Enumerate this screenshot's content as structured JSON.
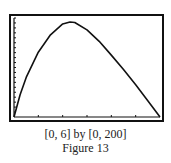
{
  "figure": {
    "window_caption": "[0, 6] by [0, 200]",
    "figure_label": "Figure 13"
  },
  "chart_data": {
    "type": "line",
    "title": "",
    "xlabel": "",
    "ylabel": "",
    "xlim": [
      0,
      6
    ],
    "ylim": [
      0,
      200
    ],
    "xscale_ticks": 1,
    "yscale_ticks": 10,
    "grid": false,
    "legend": null,
    "series": [
      {
        "name": "curve",
        "x": [
          0,
          0.25,
          0.5,
          1,
          1.5,
          2,
          2.3,
          2.5,
          3,
          3.5,
          4,
          4.5,
          5,
          5.5,
          6
        ],
        "y": [
          0,
          45,
          80,
          131,
          166,
          188,
          192,
          191,
          176,
          153,
          125,
          96,
          65,
          33,
          0
        ]
      }
    ],
    "annotations": [
      "[0, 6] by [0, 200]",
      "Figure 13"
    ]
  }
}
